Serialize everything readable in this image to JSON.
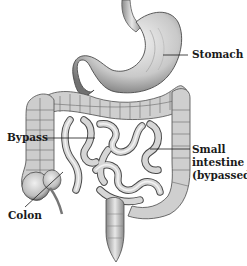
{
  "diagram": {
    "labels": {
      "stomach": "Stomach",
      "bypass": "Bypass",
      "small_intestine_line1": "Small",
      "small_intestine_line2": "intestine",
      "small_intestine_line3": "(bypassed)",
      "colon": "Colon"
    },
    "colors": {
      "background": "#ffffff",
      "ink": "#1a1a1a",
      "organ_light": "#e6e6e6",
      "organ_mid": "#b8b8b8",
      "organ_dark": "#6e6e6e"
    }
  }
}
